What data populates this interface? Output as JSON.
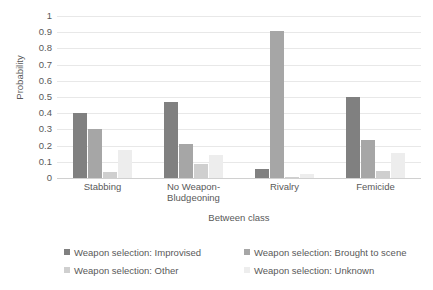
{
  "chart_data": {
    "type": "bar",
    "title": "",
    "xlabel": "Between class",
    "ylabel": "Probability",
    "ylim": [
      0,
      1
    ],
    "ytick_labels": [
      "1",
      "0.9",
      "0.8",
      "0.7",
      "0.6",
      "0.5",
      "0.4",
      "0.3",
      "0.2",
      "0.1",
      "0"
    ],
    "ytick_values": [
      1,
      0.9,
      0.8,
      0.7,
      0.6,
      0.5,
      0.4,
      0.3,
      0.2,
      0.1,
      0
    ],
    "grid": true,
    "legend_position": "bottom",
    "categories": [
      "Stabbing",
      "No Weapon-Bludgeoning",
      "Rivalry",
      "Femicide"
    ],
    "series": [
      {
        "name": "Weapon selection: Improvised",
        "color": "#808080",
        "values": [
          0.4,
          0.47,
          0.055,
          0.5
        ]
      },
      {
        "name": "Weapon selection: Brought to scene",
        "color": "#a6a6a6",
        "values": [
          0.305,
          0.21,
          0.91,
          0.235
        ]
      },
      {
        "name": "Weapon selection: Other",
        "color": "#cfcfcf",
        "values": [
          0.04,
          0.085,
          0.008,
          0.045
        ]
      },
      {
        "name": "Weapon selection: Unknown",
        "color": "#ededed",
        "values": [
          0.17,
          0.145,
          0.027,
          0.155
        ]
      }
    ]
  }
}
